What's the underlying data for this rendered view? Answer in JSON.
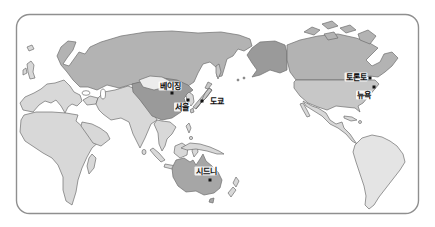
{
  "map": {
    "description_label": "pacific-centered-world-map",
    "ocean_color": "#ffffff",
    "frame_border_color": "#8f8f8f",
    "coastline_color": "#6e6e6e",
    "region_colors": {
      "russia": "#b3b3b3",
      "canada": "#b3b3b3",
      "alaska": "#9a9a9a",
      "china": "#9a9a9a",
      "mongolia": "#ececec",
      "usa": "#c7c7c7",
      "japan": "#c7c7c7",
      "europe": "#d8d8d8",
      "uk": "#d8d8d8",
      "africa": "#d8d8d8",
      "middle_east_india": "#d8d8d8",
      "arabia": "#d8d8d8",
      "se_asia": "#d8d8d8",
      "indonesia": "#d8d8d8",
      "new_guinea": "#d8d8d8",
      "korea": "#d8d8d8",
      "mexico_central_america": "#d8d8d8",
      "south_america": "#e4e4e4",
      "australia": "#a6a6a6",
      "new_zealand": "#d8d8d8"
    },
    "cities": [
      {
        "name": "beijing",
        "label": "베이징"
      },
      {
        "name": "seoul",
        "label": "서울"
      },
      {
        "name": "tokyo",
        "label": "도쿄"
      },
      {
        "name": "sydney",
        "label": "시드니"
      },
      {
        "name": "toronto",
        "label": "토론토"
      },
      {
        "name": "new_york",
        "label": "뉴욕"
      }
    ]
  }
}
